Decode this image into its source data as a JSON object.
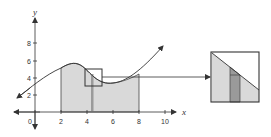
{
  "diagram": {
    "axes": {
      "x_label": "x",
      "y_label": "y",
      "origin_label": "0",
      "x_ticks": [
        "2",
        "4",
        "6",
        "8",
        "10"
      ],
      "y_ticks": [
        "2",
        "4",
        "6",
        "8"
      ]
    },
    "shaded_region": {
      "from": 2,
      "to": 8
    },
    "highlight_strip_x": 4.5,
    "zoom_box": {
      "x_from": 4,
      "x_to": 5,
      "y_from": 3,
      "y_to": 5
    },
    "colors": {
      "shade": "#d9d9d9",
      "strip": "#9a9a9a",
      "line": "#333333"
    }
  }
}
